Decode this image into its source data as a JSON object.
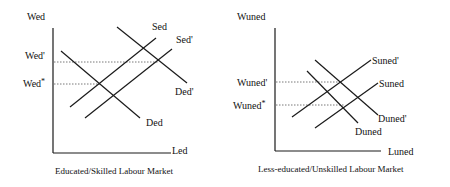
{
  "left": {
    "y_axis_label": "Wed",
    "x_axis_label": "Led",
    "price_new": "Wed'",
    "price_eq": "Wed",
    "price_eq_star": "*",
    "supply": "Sed",
    "supply_new": "Sed'",
    "demand": "Ded",
    "demand_new": "Ded'",
    "caption": "Educated/Skilled Labour Market"
  },
  "right": {
    "y_axis_label": "Wuned",
    "x_axis_label": "Luned",
    "price_new": "Wuned'",
    "price_eq": "Wuned",
    "price_eq_star": "*",
    "supply": "Suned",
    "supply_new": "Suned'",
    "demand": "Duned",
    "demand_new": "Duned'",
    "caption": "Less-educated/Unskilled Labour Market"
  },
  "colors": {
    "line": "#1a1a1a",
    "dotted": "#555555"
  }
}
